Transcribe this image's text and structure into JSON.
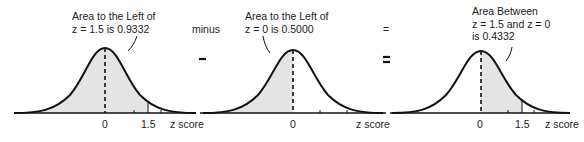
{
  "panels": [
    {
      "annotation": [
        "Area to the Left of",
        "z = 1.5 is 0.9332"
      ],
      "ticks": {
        "zero": "0",
        "z": "1.5"
      },
      "axis_label": "z score",
      "shaded": "left of z = 1.5"
    },
    {
      "annotation": [
        "Area to the Left of",
        "z = 0 is 0.5000"
      ],
      "ticks": {
        "zero": "0"
      },
      "axis_label": "z score",
      "shaded": "left of z = 0"
    },
    {
      "annotation": [
        "Area Between",
        "z = 1.5 and z = 0",
        "is 0.4332"
      ],
      "ticks": {
        "zero": "0",
        "z": "1.5"
      },
      "axis_label": "z score",
      "shaded": "between z = 0 and z = 1.5"
    }
  ],
  "operators": {
    "minus_word": "minus",
    "equals_word": "="
  },
  "colors": {
    "shade": "#e4e4e4",
    "curve": "#111111"
  }
}
